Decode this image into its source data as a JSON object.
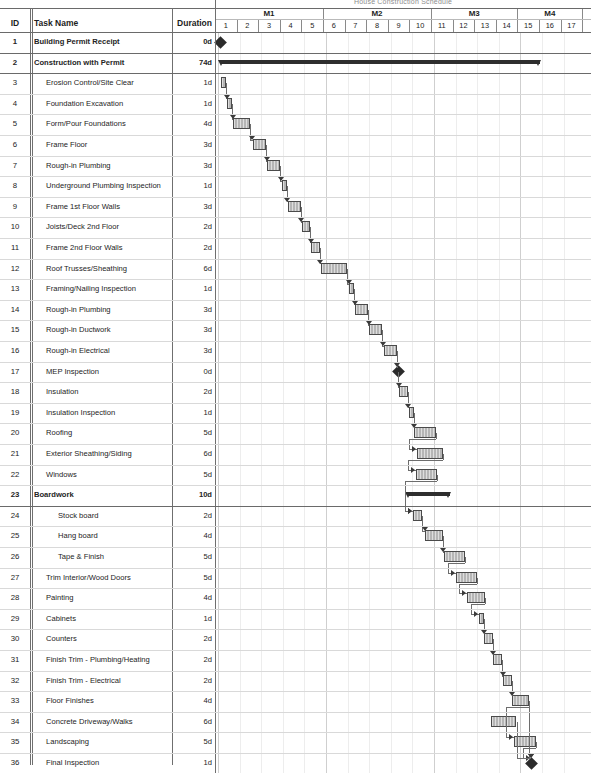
{
  "title": "House Construction Schedule",
  "columns": {
    "id": "ID",
    "task_name": "Task Name",
    "duration": "Duration"
  },
  "timeline": {
    "months": [
      {
        "label": "M1",
        "start_week": 1,
        "end_week": 5
      },
      {
        "label": "M2",
        "start_week": 6,
        "end_week": 10
      },
      {
        "label": "M3",
        "start_week": 11,
        "end_week": 14
      },
      {
        "label": "M4",
        "start_week": 15,
        "end_week": 17
      }
    ],
    "weeks": [
      "1",
      "2",
      "3",
      "4",
      "5",
      "6",
      "7",
      "8",
      "9",
      "10",
      "11",
      "12",
      "13",
      "14",
      "15",
      "16",
      "17"
    ],
    "unit": "week",
    "total_weeks": 17
  },
  "chart_data": {
    "type": "bar",
    "title": "House Construction Schedule",
    "xlabel": "Weeks",
    "ylabel": "Tasks",
    "xlim": [
      1,
      17
    ],
    "grid": true,
    "legend": "none",
    "categories": [
      "Building Permit Receipt",
      "Construction with Permit",
      "Erosion Control/Site Clear",
      "Foundation Excavation",
      "Form/Pour Foundations",
      "Frame Floor",
      "Rough-in Plumbing",
      "Underground Plumbing Inspection",
      "Frame 1st Floor Walls",
      "Joists/Deck 2nd Floor",
      "Frame 2nd Floor Walls",
      "Roof Trusses/Sheathing",
      "Framing/Nailing Inspection",
      "Rough-in Plumbing",
      "Rough-in Ductwork",
      "Rough-in Electrical",
      "MEP Inspection",
      "Insulation",
      "Insulation Inspection",
      "Roofing",
      "Exterior Sheathing/Siding",
      "Windows",
      "Boardwork",
      "Stock board",
      "Hang board",
      "Tape & Finish",
      "Trim Interior/Wood Doors",
      "Painting",
      "Cabinets",
      "Counters",
      "Finish Trim - Plumbing/Heating",
      "Finish Trim - Electrical",
      "Floor Finishes",
      "Concrete Driveway/Walks",
      "Landscaping",
      "Final Inspection"
    ],
    "values": [
      0,
      74,
      1,
      1,
      4,
      3,
      3,
      1,
      3,
      2,
      2,
      6,
      1,
      3,
      3,
      3,
      0,
      2,
      1,
      5,
      6,
      5,
      10,
      2,
      4,
      5,
      5,
      4,
      1,
      2,
      2,
      2,
      4,
      6,
      5,
      1
    ],
    "value_unit": "days"
  },
  "tasks": [
    {
      "id": "1",
      "name": "Building Permit Receipt",
      "duration": "0d",
      "level": 1,
      "bold": true,
      "kind": "milestone",
      "start": 0.1,
      "days": 0
    },
    {
      "id": "2",
      "name": "Construction with Permit",
      "duration": "74d",
      "level": 1,
      "bold": true,
      "kind": "summary",
      "start": 0.1,
      "days": 74
    },
    {
      "id": "3",
      "name": "Erosion Control/Site Clear",
      "duration": "1d",
      "level": 2,
      "bold": false,
      "kind": "task",
      "start": 0.15,
      "days": 1
    },
    {
      "id": "4",
      "name": "Foundation Excavation",
      "duration": "1d",
      "level": 2,
      "bold": false,
      "kind": "task",
      "start": 0.42,
      "days": 1
    },
    {
      "id": "5",
      "name": "Form/Pour Foundations",
      "duration": "4d",
      "level": 2,
      "bold": false,
      "kind": "task",
      "start": 0.7,
      "days": 4
    },
    {
      "id": "6",
      "name": "Frame Floor",
      "duration": "3d",
      "level": 2,
      "bold": false,
      "kind": "task",
      "start": 1.62,
      "days": 3
    },
    {
      "id": "7",
      "name": "Rough-in Plumbing",
      "duration": "3d",
      "level": 2,
      "bold": false,
      "kind": "task",
      "start": 2.28,
      "days": 3
    },
    {
      "id": "8",
      "name": "Underground Plumbing Inspection",
      "duration": "1d",
      "level": 2,
      "bold": false,
      "kind": "task",
      "start": 2.95,
      "days": 1
    },
    {
      "id": "9",
      "name": "Frame 1st Floor Walls",
      "duration": "3d",
      "level": 2,
      "bold": false,
      "kind": "task",
      "start": 3.22,
      "days": 3
    },
    {
      "id": "10",
      "name": "Joists/Deck 2nd Floor",
      "duration": "2d",
      "level": 2,
      "bold": false,
      "kind": "task",
      "start": 3.88,
      "days": 2
    },
    {
      "id": "11",
      "name": "Frame 2nd Floor Walls",
      "duration": "2d",
      "level": 2,
      "bold": false,
      "kind": "task",
      "start": 4.32,
      "days": 2
    },
    {
      "id": "12",
      "name": "Roof Trusses/Sheathing",
      "duration": "6d",
      "level": 2,
      "bold": false,
      "kind": "task",
      "start": 4.76,
      "days": 6
    },
    {
      "id": "13",
      "name": "Framing/Nailing Inspection",
      "duration": "1d",
      "level": 2,
      "bold": false,
      "kind": "task",
      "start": 6.08,
      "days": 1
    },
    {
      "id": "14",
      "name": "Rough-in Plumbing",
      "duration": "3d",
      "level": 2,
      "bold": false,
      "kind": "task",
      "start": 6.35,
      "days": 3
    },
    {
      "id": "15",
      "name": "Rough-in Ductwork",
      "duration": "3d",
      "level": 2,
      "bold": false,
      "kind": "task",
      "start": 7.01,
      "days": 3
    },
    {
      "id": "16",
      "name": "Rough-in Electrical",
      "duration": "3d",
      "level": 2,
      "bold": false,
      "kind": "task",
      "start": 7.67,
      "days": 3
    },
    {
      "id": "17",
      "name": "MEP Inspection",
      "duration": "0d",
      "level": 2,
      "bold": false,
      "kind": "milestone",
      "start": 8.33,
      "days": 0
    },
    {
      "id": "18",
      "name": "Insulation",
      "duration": "2d",
      "level": 2,
      "bold": false,
      "kind": "task",
      "start": 8.38,
      "days": 2
    },
    {
      "id": "19",
      "name": "Insulation Inspection",
      "duration": "1d",
      "level": 2,
      "bold": false,
      "kind": "task",
      "start": 8.82,
      "days": 1
    },
    {
      "id": "20",
      "name": "Roofing",
      "duration": "5d",
      "level": 2,
      "bold": false,
      "kind": "task",
      "start": 9.09,
      "days": 5
    },
    {
      "id": "21",
      "name": "Exterior Sheathing/Siding",
      "duration": "6d",
      "level": 2,
      "bold": false,
      "kind": "task",
      "start": 9.2,
      "days": 6
    },
    {
      "id": "22",
      "name": "Windows",
      "duration": "5d",
      "level": 2,
      "bold": false,
      "kind": "task",
      "start": 9.15,
      "days": 5
    },
    {
      "id": "23",
      "name": "Boardwork",
      "duration": "10d",
      "level": 1,
      "bold": true,
      "kind": "summary",
      "start": 8.75,
      "days": 10
    },
    {
      "id": "24",
      "name": "Stock board",
      "duration": "2d",
      "level": 3,
      "bold": false,
      "kind": "task",
      "start": 9.05,
      "days": 2
    },
    {
      "id": "25",
      "name": "Hang board",
      "duration": "4d",
      "level": 3,
      "bold": false,
      "kind": "task",
      "start": 9.6,
      "days": 4
    },
    {
      "id": "26",
      "name": "Tape & Finish",
      "duration": "5d",
      "level": 3,
      "bold": false,
      "kind": "task",
      "start": 10.45,
      "days": 5
    },
    {
      "id": "27",
      "name": "Trim Interior/Wood Doors",
      "duration": "5d",
      "level": 2,
      "bold": false,
      "kind": "task",
      "start": 11.0,
      "days": 5
    },
    {
      "id": "28",
      "name": "Painting",
      "duration": "4d",
      "level": 2,
      "bold": false,
      "kind": "task",
      "start": 11.55,
      "days": 4
    },
    {
      "id": "29",
      "name": "Cabinets",
      "duration": "1d",
      "level": 2,
      "bold": false,
      "kind": "task",
      "start": 12.1,
      "days": 1
    },
    {
      "id": "30",
      "name": "Counters",
      "duration": "2d",
      "level": 2,
      "bold": false,
      "kind": "task",
      "start": 12.33,
      "days": 2
    },
    {
      "id": "31",
      "name": "Finish Trim - Plumbing/Heating",
      "duration": "2d",
      "level": 2,
      "bold": false,
      "kind": "task",
      "start": 12.75,
      "days": 2
    },
    {
      "id": "32",
      "name": "Finish Trim - Electrical",
      "duration": "2d",
      "level": 2,
      "bold": false,
      "kind": "task",
      "start": 13.2,
      "days": 2
    },
    {
      "id": "33",
      "name": "Floor Finishes",
      "duration": "4d",
      "level": 2,
      "bold": false,
      "kind": "task",
      "start": 13.62,
      "days": 4
    },
    {
      "id": "34",
      "name": "Concrete Driveway/Walks",
      "duration": "6d",
      "level": 2,
      "bold": false,
      "kind": "task",
      "start": 12.62,
      "days": 6
    },
    {
      "id": "35",
      "name": "Landscaping",
      "duration": "5d",
      "level": 2,
      "bold": false,
      "kind": "task",
      "start": 13.7,
      "days": 5
    },
    {
      "id": "36",
      "name": "Final Inspection",
      "duration": "1d",
      "level": 2,
      "bold": false,
      "kind": "milestone",
      "start": 14.5,
      "days": 1
    }
  ]
}
